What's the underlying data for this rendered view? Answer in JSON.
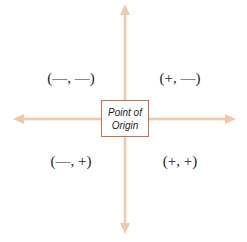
{
  "diagram": {
    "type": "coordinate-plane-quadrants",
    "colors": {
      "axis": "#f3c8a6",
      "box_border": "#c8704a",
      "text": "#231f20"
    },
    "origin_label": {
      "line1": "Point of",
      "line2": "Origin"
    },
    "quadrants": {
      "top_left": "(—, —)",
      "top_right": "(+, —)",
      "bottom_left": "(—, +)",
      "bottom_right": "(+, +)"
    }
  }
}
